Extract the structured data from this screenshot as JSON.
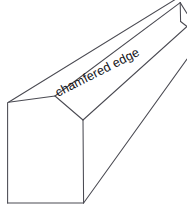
{
  "drawing": {
    "title": "chamfered edge",
    "subject": "square bar with chamfered edge",
    "annotations": [
      {
        "id": "chamfer-label",
        "text": "chamfered edge",
        "rotation_deg": -27,
        "x": 58,
        "y": 97
      }
    ],
    "colors": {
      "background": "#ffffff",
      "line": "#4a4a52",
      "face": "#ffffff",
      "text": "#15151a"
    },
    "geometry": {
      "projection": "oblique",
      "near_end_face": {
        "points": "8,102 55,96 83,120 83,203 7,203",
        "label": "near end face"
      },
      "chamfer_strip": {
        "points": "55,96 180,3 187,26 83,120",
        "label": "chamfer strip"
      },
      "top_face": {
        "points": "8,102 55,96 180,3 131,0",
        "label": "top face"
      },
      "right_face": {
        "points": "83,120 187,26 187,210 83,203",
        "label": "right side face"
      },
      "lines": [
        {
          "name": "end-top-left-to-chamfer-top",
          "d": "M 8.5,102 L 55,96"
        },
        {
          "name": "end-chamfer-cut",
          "d": "M 55,96 L 83,120"
        },
        {
          "name": "end-right-vertical",
          "d": "M 83,120 L 83.5,203"
        },
        {
          "name": "end-bottom",
          "d": "M 7.5,203 L 83.5,203"
        },
        {
          "name": "end-left-vertical",
          "d": "M 7.5,102.5 L 7.5,203"
        },
        {
          "name": "top-back-receding",
          "d": "M 8.5,102 L 175,0"
        },
        {
          "name": "chamfer-upper-receding",
          "d": "M 55,96 L 180,3"
        },
        {
          "name": "chamfer-lower-receding",
          "d": "M 83,120 L 186,27"
        },
        {
          "name": "bottom-front-receding",
          "d": "M 83.5,203 L 186,60"
        },
        {
          "name": "far-end-vertical",
          "d": "M 180,3 L 180.5,22"
        },
        {
          "name": "far-end-chamfer-cut",
          "d": "M 180,3 L 186.5,14"
        },
        {
          "name": "far-end-lower",
          "d": "M 180.5,22 L 186.5,27"
        }
      ]
    }
  }
}
